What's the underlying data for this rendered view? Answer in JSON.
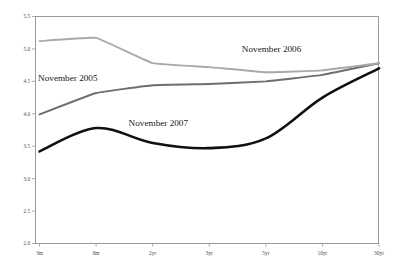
{
  "chart_data": {
    "type": "line",
    "title": "",
    "subtitle": "",
    "xlabel": "",
    "ylabel": "",
    "categories": [
      "3m",
      "6m",
      "2yr",
      "3yr",
      "5yr",
      "10yr",
      "30yr"
    ],
    "ylim": [
      2.0,
      5.5
    ],
    "yticks": [
      "2.0",
      "2.5",
      "3.0",
      "3.5",
      "4.0",
      "4.5",
      "5.0",
      "5.5"
    ],
    "ytick_values": [
      2.0,
      2.5,
      3.0,
      3.5,
      4.0,
      4.5,
      5.0,
      5.5
    ],
    "grid": false,
    "legend_position": "inline-annotations",
    "series": [
      {
        "name": "November 2005",
        "color": "#6e6e6e",
        "width": 1.9,
        "values": [
          3.99,
          4.32,
          4.44,
          4.46,
          4.5,
          4.6,
          4.78
        ],
        "annotation": {
          "text": "November 2005",
          "x": 0.5,
          "y": 4.5
        }
      },
      {
        "name": "November 2006",
        "color": "#a9a9a9",
        "width": 1.9,
        "values": [
          5.12,
          5.17,
          4.78,
          4.72,
          4.64,
          4.67,
          4.78
        ],
        "annotation": {
          "text": "November 2006",
          "x": 4.1,
          "y": 4.95
        }
      },
      {
        "name": "November 2007",
        "color": "#101010",
        "width": 2.6,
        "values": [
          3.42,
          3.78,
          3.55,
          3.47,
          3.62,
          4.25,
          4.7
        ],
        "annotation": {
          "text": "November 2007",
          "x": 2.1,
          "y": 3.81
        }
      }
    ]
  }
}
